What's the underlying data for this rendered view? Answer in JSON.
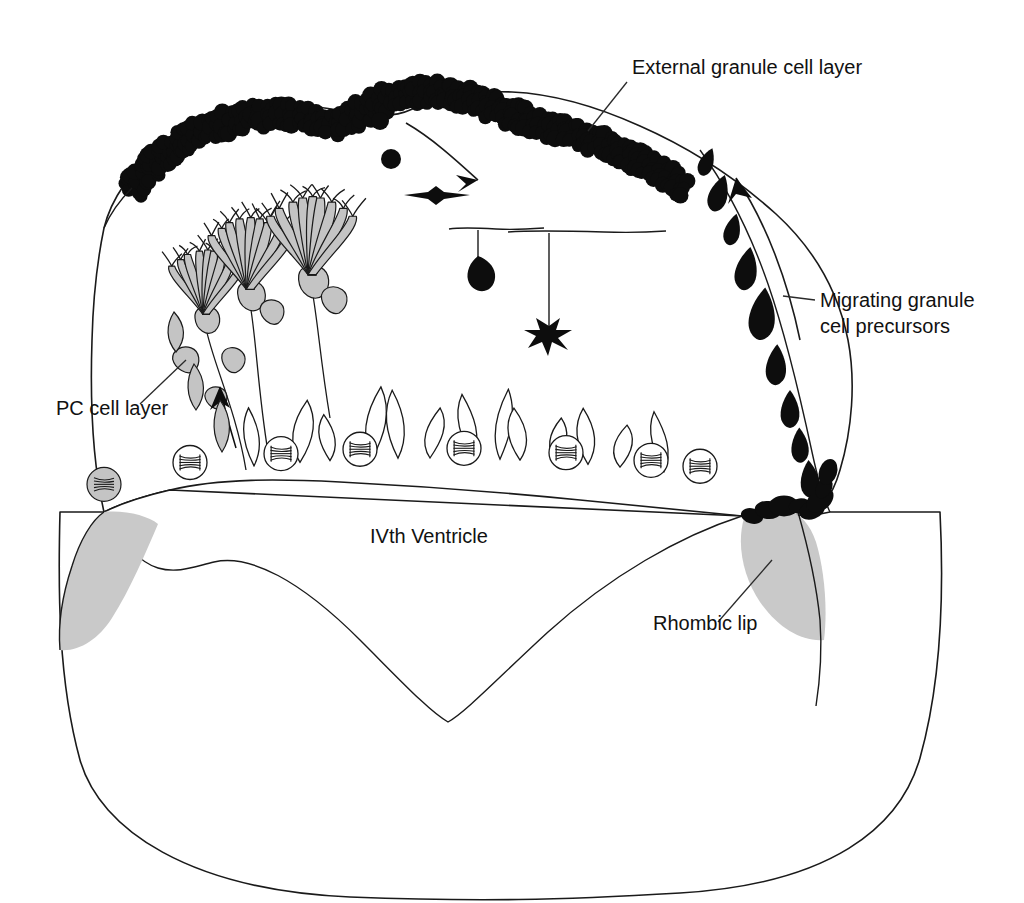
{
  "figure": {
    "background_color": "#ffffff",
    "ink_color": "#111111",
    "gray_fill_color": "#c9c9c9",
    "black_cell_color": "#0d0d0d"
  },
  "labels": {
    "external_granule_cell_layer": "External granule cell layer",
    "migrating_granule_cell_precursors": "Migrating granule\ncell precursors",
    "migrating_line_1": "Migrating granule",
    "migrating_line_2": "cell precursors",
    "pc_cell_layer": "PC cell layer",
    "ivth_ventricle": "IVth Ventricle",
    "rhombic_lip": "Rhombic lip"
  },
  "label_positions": {
    "external_granule_cell_layer": {
      "x": 632,
      "y": 74,
      "anchor": "start"
    },
    "migrating_line_1": {
      "x": 820,
      "y": 307,
      "anchor": "start"
    },
    "migrating_line_2": {
      "x": 820,
      "y": 333,
      "anchor": "start"
    },
    "pc_cell_layer": {
      "x": 56,
      "y": 415,
      "anchor": "start"
    },
    "ivth_ventricle": {
      "x": 370,
      "y": 543,
      "anchor": "start"
    },
    "rhombic_lip": {
      "x": 653,
      "y": 630,
      "anchor": "start"
    }
  },
  "leader_lines": [
    {
      "name": "leader-egl",
      "from": [
        627,
        82
      ],
      "to": [
        588,
        131
      ]
    },
    {
      "name": "leader-migrating",
      "from": [
        815,
        300
      ],
      "to": [
        783,
        296
      ]
    },
    {
      "name": "leader-pc",
      "from": [
        140,
        404
      ],
      "to": [
        186,
        360
      ]
    },
    {
      "name": "leader-rhombic-lip",
      "from": [
        718,
        622
      ],
      "to": [
        772,
        560
      ]
    }
  ],
  "structures": {
    "cerebellar_outline": {
      "name": "cerebellar-primordium-outline",
      "description": "Closed outline of the developing cerebellum in sagittal section"
    },
    "external_granule_cell_layer": {
      "name": "external-granule-cell-layer",
      "cell_count": 118,
      "cell_shape": "round",
      "color": "#0d0d0d"
    },
    "migrating_precursors": {
      "name": "migrating-granule-cell-precursors",
      "cell_count": 9,
      "cell_shape": "teardrop",
      "color": "#0d0d0d"
    },
    "rhombic_lips": [
      {
        "name": "rhombic-lip-left",
        "side": "left",
        "fill": "#c9c9c9",
        "has_dark_cells": false
      },
      {
        "name": "rhombic-lip-right",
        "side": "right",
        "fill": "#c9c9c9",
        "has_dark_cells": true,
        "dark_cell_count": 8
      }
    ],
    "purkinje_cells": {
      "name": "purkinje-cell-layer",
      "mature_count": 3,
      "immature_soma_count": 5,
      "fill": "#c4c4c4",
      "maturity_order": "left-to-right increasing"
    },
    "ventricular_zone": {
      "name": "ventricular-zone",
      "mitotic_figure_count": 7,
      "spindle_precursor_count": 13,
      "gray_precursor_count": 3
    },
    "differentiation_series": {
      "name": "granule-cell-differentiation-series",
      "stages": [
        {
          "stage": 1,
          "name": "round-granule-precursor",
          "shape": "circle"
        },
        {
          "stage": 2,
          "name": "round-granule-precursor",
          "shape": "circle"
        },
        {
          "stage": 3,
          "name": "bipolar-granule-cell",
          "shape": "horizontal-spindle"
        },
        {
          "stage": 4,
          "name": "t-shaped-granule-cell",
          "shape": "T-with-short-axon"
        },
        {
          "stage": 5,
          "name": "mature-granule-cell",
          "shape": "T-with-long-axon-and-claws"
        }
      ]
    }
  },
  "arrows": [
    {
      "name": "arrow-egl-to-inward-migration",
      "type": "curved",
      "direction": "down-right"
    },
    {
      "name": "arrow-migration-up-right-edge",
      "type": "curved",
      "direction": "up"
    },
    {
      "name": "arrow-purkinje-migration-up",
      "type": "straight",
      "direction": "up"
    }
  ]
}
